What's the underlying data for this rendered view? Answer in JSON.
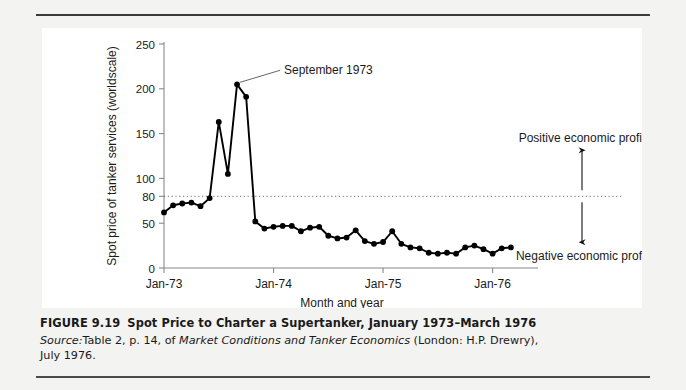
{
  "figure": {
    "caption_number": "FIGURE 9.19",
    "caption_title": "Spot Price to Charter a Supertanker, January 1973–March 1976",
    "source_label": "Source:",
    "source_text_1": "Table 2, p. 14, of ",
    "source_italic": "Market Conditions and Tanker Economics",
    "source_text_2": " (London: H.P. Drewry),",
    "source_text_3": "July 1976."
  },
  "annotations": {
    "peak_label": "September 1973",
    "positive_profit": "Positive economic profit",
    "negative_profit": "Negative economic profit",
    "breakeven_value": 80
  },
  "colors": {
    "line": "#000000",
    "marker": "#000000",
    "axis": "#8a8a8a",
    "panel": "#ffffff",
    "page": "#f3f3f2",
    "rule": "#3b3b3b",
    "text": "#1b1b1b"
  },
  "chart_data": {
    "type": "line",
    "title": "Spot Price to Charter a Supertanker, January 1973–March 1976",
    "xlabel": "Month and year",
    "ylabel": "Spot price of tanker services (worldscale)",
    "xlim": [
      0,
      39
    ],
    "ylim": [
      0,
      250
    ],
    "grid": false,
    "legend": "none",
    "ytick_values": [
      0,
      50,
      80,
      100,
      150,
      200,
      250
    ],
    "ytick_labels": [
      "0",
      "50",
      "80",
      "100",
      "150",
      "200",
      "250"
    ],
    "xtick_values": [
      0,
      12,
      24,
      36
    ],
    "xtick_labels": [
      "Jan-73",
      "Jan-74",
      "Jan-75",
      "Jan-76"
    ],
    "reference_line": {
      "y": 80,
      "style": "dotted",
      "label": "break-even"
    },
    "x": [
      0,
      1,
      2,
      3,
      4,
      5,
      6,
      7,
      8,
      9,
      10,
      11,
      12,
      13,
      14,
      15,
      16,
      17,
      18,
      19,
      20,
      21,
      22,
      23,
      24,
      25,
      26,
      27,
      28,
      29,
      30,
      31,
      32,
      33,
      34,
      35,
      36,
      37,
      38
    ],
    "y": [
      62,
      70,
      72,
      73,
      69,
      78,
      163,
      105,
      205,
      191,
      52,
      44,
      46,
      47,
      47,
      41,
      45,
      46,
      36,
      33,
      34,
      42,
      30,
      27,
      29,
      41,
      27,
      23,
      22,
      17,
      16,
      17,
      16,
      23,
      25,
      21,
      16,
      22,
      23
    ],
    "annotations": [
      {
        "text": "September 1973",
        "x": 8,
        "y": 205
      },
      {
        "text": "Positive economic profit",
        "x": 33,
        "y": 140
      },
      {
        "text": "Negative economic profit",
        "x": 33,
        "y": 45
      }
    ]
  }
}
